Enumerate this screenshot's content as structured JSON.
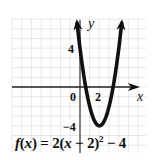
{
  "chart_data": {
    "type": "line",
    "title": "",
    "equation": "f(x) = 2(x − 2)² − 4",
    "function": {
      "a": 2,
      "h": 2,
      "k": -4
    },
    "vertex": [
      2,
      -4
    ],
    "xlabel": "x",
    "ylabel": "y",
    "tick_labels": {
      "x": [
        "0",
        "2"
      ],
      "y": [
        "4",
        "-4"
      ]
    },
    "xlim": [
      -7,
      6.5
    ],
    "ylim": [
      -6.8,
      7
    ],
    "grid": true,
    "arrows": {
      "curve_ends": true,
      "x_axis_positive": true,
      "y_axis_positive": true
    },
    "x": [
      -0.35,
      0,
      0.5,
      1,
      1.5,
      2,
      2.5,
      3,
      3.5,
      4,
      4.35
    ],
    "values": [
      7.05,
      4,
      0.5,
      -2,
      -3.5,
      -4,
      -3.5,
      -2,
      0.5,
      4,
      7.05
    ],
    "colors": {
      "curve": "#111111",
      "axis": "#222222",
      "grid": "#d6d6d6"
    }
  },
  "labels": {
    "x_axis": "x",
    "y_axis": "y",
    "origin": "0",
    "x_tick": "2",
    "y_tick_pos": "4",
    "y_tick_neg": "−4",
    "eq_f": "f",
    "eq_open": "(",
    "eq_x": "x",
    "eq_close_eq": ") = 2(",
    "eq_x2": "x",
    "eq_rest": " − 2)",
    "eq_sup": "2",
    "eq_tail": " − 4"
  }
}
